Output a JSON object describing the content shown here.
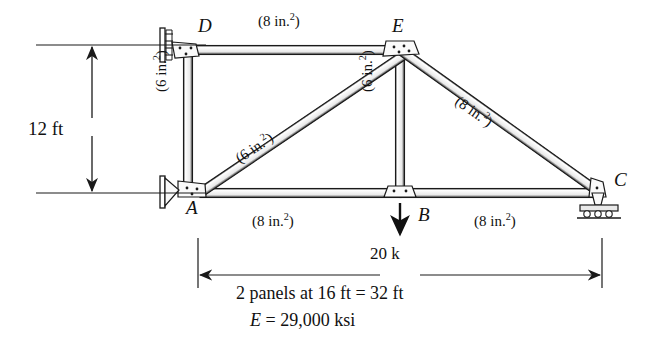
{
  "figure": {
    "type": "truss-diagram",
    "background": "#ffffff",
    "ink": "#1a1a1a"
  },
  "nodes": [
    {
      "id": "D",
      "label": "D",
      "x": 188,
      "y": 50,
      "support": "pin-wall",
      "label_x": 198,
      "label_y": 16
    },
    {
      "id": "E",
      "label": "E",
      "x": 400,
      "y": 50,
      "support": "none",
      "label_x": 392,
      "label_y": 16
    },
    {
      "id": "A",
      "label": "A",
      "x": 200,
      "y": 193,
      "support": "pin-wall",
      "label_x": 186,
      "label_y": 198
    },
    {
      "id": "B",
      "label": "B",
      "x": 400,
      "y": 193,
      "support": "none",
      "label_x": 418,
      "label_y": 205
    },
    {
      "id": "C",
      "label": "C",
      "x": 600,
      "y": 193,
      "support": "roller",
      "label_x": 614,
      "label_y": 170
    }
  ],
  "members": [
    {
      "id": "DE",
      "from": "D",
      "to": "E",
      "area_label": "(8 in.",
      "area_sup": "2",
      "area_tail": ")",
      "label_x": 258,
      "label_y": 12,
      "rotation": 0
    },
    {
      "id": "DA",
      "from": "D",
      "to": "A",
      "area_label": "(6 in.",
      "area_sup": "2",
      "area_tail": ")",
      "label_x": 152,
      "label_y": 92,
      "rotation": -90
    },
    {
      "id": "AE",
      "from": "A",
      "to": "E",
      "area_label": "(6 in.",
      "area_sup": "2",
      "area_tail": ")",
      "label_x": 232,
      "label_y": 120,
      "rotation": -34
    },
    {
      "id": "EB",
      "from": "E",
      "to": "B",
      "area_label": "(6 in.",
      "area_sup": "2",
      "area_tail": ")",
      "label_x": 358,
      "label_y": 92,
      "rotation": -90
    },
    {
      "id": "EC",
      "from": "E",
      "to": "C",
      "area_label": "(8 in.",
      "area_sup": "2",
      "area_tail": ")",
      "label_x": 472,
      "label_y": 100,
      "rotation": 35
    },
    {
      "id": "AB",
      "from": "A",
      "to": "B",
      "area_label": "(8 in.",
      "area_sup": "2",
      "area_tail": ")",
      "label_x": 252,
      "label_y": 212,
      "rotation": 0
    },
    {
      "id": "BC",
      "from": "B",
      "to": "C",
      "area_label": "(8 in.",
      "area_sup": "2",
      "area_tail": ")",
      "label_x": 474,
      "label_y": 212,
      "rotation": 0
    }
  ],
  "loads": [
    {
      "id": "P-at-B",
      "magnitude": "20 k",
      "direction": "down",
      "at_node": "B",
      "label_x": 370,
      "label_y": 245
    }
  ],
  "dimensions": [
    {
      "id": "height-dim",
      "text": "12 ft",
      "orientation": "vertical",
      "label_x": 28,
      "label_y": 126,
      "from_y": 45,
      "to_y": 193,
      "at_x": 92
    },
    {
      "id": "span-dim",
      "text": "2 panels at 16 ft = 32 ft",
      "orientation": "horizontal",
      "label_x": 236,
      "label_y": 284,
      "from_x": 198,
      "to_x": 602,
      "at_y": 275
    }
  ],
  "captions": [
    {
      "id": "modulus",
      "prefix": "E",
      "rest": " = 29,000 ksi",
      "x": 250,
      "y": 311
    }
  ]
}
